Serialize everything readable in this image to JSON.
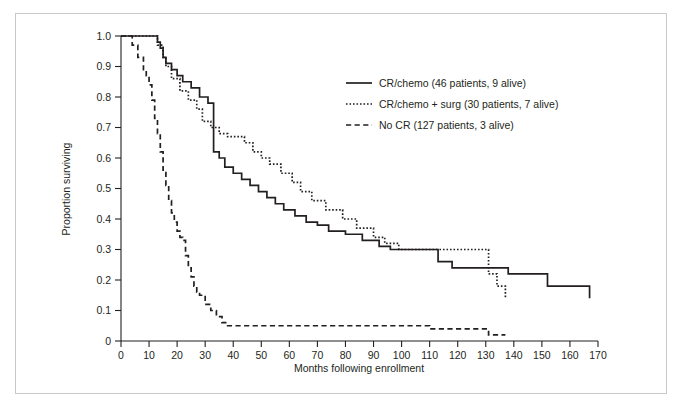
{
  "figure": {
    "border_color": "#c9c9c9",
    "background": "#ffffff"
  },
  "chart_data": {
    "type": "line",
    "title": "",
    "subtitle": "",
    "xlabel": "Months following enrollment",
    "ylabel": "Proportion surviving",
    "xlim": [
      0,
      170
    ],
    "ylim": [
      0,
      1.0
    ],
    "xticks": [
      0,
      10,
      20,
      30,
      40,
      50,
      60,
      70,
      80,
      90,
      100,
      110,
      120,
      130,
      140,
      150,
      160,
      170
    ],
    "yticks": [
      0,
      0.1,
      0.2,
      0.3,
      0.4,
      0.5,
      0.6,
      0.7,
      0.8,
      0.9,
      1.0
    ],
    "xtick_labels": [
      "0",
      "10",
      "20",
      "30",
      "40",
      "50",
      "60",
      "70",
      "80",
      "90",
      "100",
      "110",
      "120",
      "130",
      "140",
      "150",
      "160",
      "170"
    ],
    "ytick_labels": [
      "0",
      "0.1",
      "0.2",
      "0.3",
      "0.4",
      "0.5",
      "0.6",
      "0.7",
      "0.8",
      "0.9",
      "1.0"
    ],
    "grid": false,
    "legend_position": "upper-center",
    "step_type": "post",
    "series": [
      {
        "name": "CR/chemo (46 patients, 9 alive)",
        "style": "solid",
        "color": "#231f20",
        "x": [
          0,
          11,
          13,
          14,
          15,
          16,
          18,
          20,
          22,
          25,
          28,
          31,
          33,
          33,
          35,
          37,
          40,
          43,
          46,
          49,
          52,
          55,
          58,
          62,
          66,
          70,
          74,
          80,
          86,
          92,
          96,
          108,
          113,
          118,
          123,
          131,
          138,
          152,
          167
        ],
        "y": [
          1.0,
          1.0,
          0.98,
          0.96,
          0.93,
          0.91,
          0.89,
          0.87,
          0.85,
          0.83,
          0.8,
          0.78,
          0.7,
          0.62,
          0.6,
          0.57,
          0.55,
          0.53,
          0.51,
          0.49,
          0.47,
          0.45,
          0.43,
          0.41,
          0.39,
          0.38,
          0.36,
          0.35,
          0.33,
          0.31,
          0.3,
          0.3,
          0.26,
          0.24,
          0.24,
          0.24,
          0.22,
          0.18,
          0.14
        ]
      },
      {
        "name": "CR/chemo + surg (30 patients, 7 alive)",
        "style": "dotted",
        "color": "#231f20",
        "x": [
          0,
          11,
          13,
          15,
          16,
          18,
          21,
          24,
          27,
          29,
          32,
          35,
          38,
          41,
          44,
          47,
          50,
          53,
          57,
          61,
          64,
          68,
          73,
          79,
          84,
          90,
          94,
          99,
          104,
          112,
          118,
          126,
          131,
          134,
          137
        ],
        "y": [
          1.0,
          1.0,
          0.97,
          0.93,
          0.9,
          0.86,
          0.82,
          0.79,
          0.76,
          0.72,
          0.7,
          0.68,
          0.67,
          0.67,
          0.65,
          0.62,
          0.6,
          0.58,
          0.55,
          0.52,
          0.49,
          0.46,
          0.43,
          0.4,
          0.37,
          0.34,
          0.32,
          0.3,
          0.3,
          0.3,
          0.3,
          0.3,
          0.22,
          0.18,
          0.14
        ]
      },
      {
        "name": "No CR (127 patients, 3 alive)",
        "style": "dashed",
        "color": "#231f20",
        "x": [
          0,
          4,
          6,
          8,
          9,
          10,
          11,
          12,
          13,
          14,
          15,
          16,
          17,
          18,
          19,
          20,
          21,
          22,
          23,
          24,
          25,
          26,
          27,
          28,
          30,
          32,
          34,
          36,
          38,
          108,
          110,
          120,
          128,
          131,
          137
        ],
        "y": [
          1.0,
          0.97,
          0.93,
          0.89,
          0.87,
          0.84,
          0.79,
          0.73,
          0.68,
          0.62,
          0.56,
          0.51,
          0.46,
          0.42,
          0.39,
          0.36,
          0.34,
          0.33,
          0.28,
          0.24,
          0.21,
          0.18,
          0.16,
          0.15,
          0.12,
          0.1,
          0.08,
          0.06,
          0.05,
          0.05,
          0.04,
          0.04,
          0.04,
          0.02,
          0.02
        ]
      }
    ]
  },
  "legend": {
    "entries": [
      {
        "label": "CR/chemo (46 patients, 9 alive)",
        "style": "solid"
      },
      {
        "label": "CR/chemo + surg (30 patients, 7 alive)",
        "style": "dotted"
      },
      {
        "label": "No CR (127 patients, 3 alive)",
        "style": "dashed"
      }
    ]
  }
}
